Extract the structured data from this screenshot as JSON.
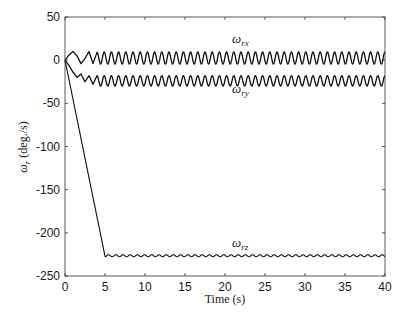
{
  "chart_data": {
    "type": "line",
    "title": "",
    "xlabel": "Time (s)",
    "ylabel": "ω_r (deg./s)",
    "xlim": [
      0,
      40
    ],
    "ylim": [
      -250,
      50
    ],
    "xticks": [
      0,
      5,
      10,
      15,
      20,
      25,
      30,
      35,
      40
    ],
    "yticks": [
      50,
      0,
      -50,
      -100,
      -150,
      -200,
      -250
    ],
    "grid": false,
    "legend": "inline labels",
    "series": [
      {
        "name": "ω_rx",
        "label_base": "ω",
        "label_sub": "rx",
        "description": "small transient then sustained oscillation",
        "x": [
          0,
          0.5,
          1,
          1.5,
          2,
          2.5,
          3,
          3.5,
          4,
          40
        ],
        "values": [
          0,
          6,
          10,
          5,
          -4,
          2,
          10,
          -4,
          9,
          3
        ],
        "steady_center": 2.5,
        "steady_amplitude": 7,
        "steady_period": 0.9
      },
      {
        "name": "ω_ry",
        "label_base": "ω",
        "label_sub": "ry",
        "description": "transient dip then sustained oscillation",
        "x": [
          0,
          0.5,
          1,
          1.5,
          2,
          2.5,
          3,
          3.5,
          4,
          40
        ],
        "values": [
          0,
          -6,
          -14,
          -20,
          -16,
          -25,
          -18,
          -28,
          -18,
          -24
        ],
        "steady_center": -24,
        "steady_amplitude": 6,
        "steady_period": 0.9
      },
      {
        "name": "ω_rz",
        "label_base": "ω",
        "label_sub": "rz",
        "description": "linear ramp down then flat with small ripple",
        "x": [
          0,
          5,
          40
        ],
        "values": [
          0,
          -227,
          -227
        ],
        "steady_center": -226.5,
        "steady_amplitude": 1.2,
        "steady_period": 0.9
      }
    ],
    "annotations": [
      {
        "text": "ω_rx",
        "x": 21,
        "y": 19
      },
      {
        "text": "ω_ry",
        "x": 21,
        "y": -37
      },
      {
        "text": "ω_rz",
        "x": 21,
        "y": -216
      }
    ]
  },
  "axes": {
    "x_title": "Time (s)",
    "y_title_base": "ω",
    "y_title_sub": "r",
    "y_title_unit": " (deg./s)"
  },
  "labels": {
    "rx_base": "ω",
    "rx_sub": "rx",
    "ry_base": "ω",
    "ry_sub": "ry",
    "rz_base": "ω",
    "rz_sub": "rz"
  }
}
